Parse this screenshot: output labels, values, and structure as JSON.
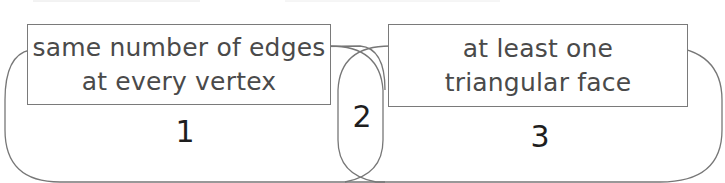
{
  "diagram": {
    "type": "venn",
    "sets": [
      {
        "name": "left-set",
        "label_lines": [
          "same number of edges",
          "at every vertex"
        ]
      },
      {
        "name": "right-set",
        "label_lines": [
          "at least one",
          "triangular face"
        ]
      }
    ],
    "regions": {
      "left_only": "1",
      "intersection": "2",
      "right_only": "3"
    },
    "colors": {
      "outline": "#777777",
      "label_text": "#4a4a4a",
      "number_text": "#1e1e1e"
    }
  }
}
